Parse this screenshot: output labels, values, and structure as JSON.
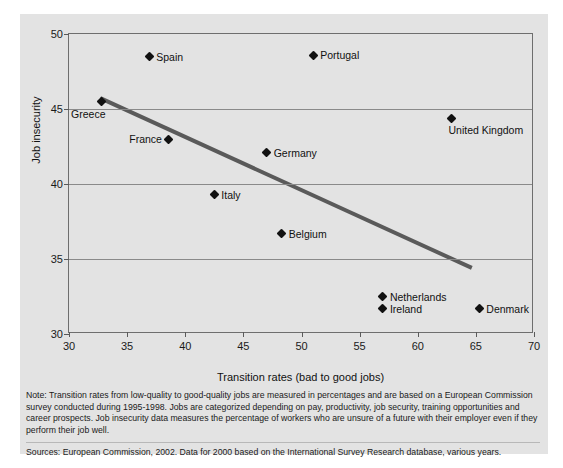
{
  "chart_data": {
    "type": "scatter",
    "title": "",
    "xlabel": "Transition rates (bad to good jobs)",
    "ylabel": "Job insecurity",
    "xlim": [
      30,
      70
    ],
    "ylim": [
      30,
      50
    ],
    "xticks": [
      30,
      35,
      40,
      45,
      50,
      55,
      60,
      65,
      70
    ],
    "yticks": [
      30,
      35,
      40,
      45,
      50
    ],
    "grid": "horizontal",
    "legend": "none",
    "points": [
      {
        "label": "Greece",
        "x": 32.8,
        "y": 45.5,
        "label_pos": "below-left"
      },
      {
        "label": "Spain",
        "x": 36.9,
        "y": 48.5,
        "label_pos": "right"
      },
      {
        "label": "France",
        "x": 38.6,
        "y": 43.0,
        "label_pos": "left"
      },
      {
        "label": "Italy",
        "x": 42.5,
        "y": 39.3,
        "label_pos": "right"
      },
      {
        "label": "Germany",
        "x": 47.0,
        "y": 42.1,
        "label_pos": "right"
      },
      {
        "label": "Belgium",
        "x": 48.3,
        "y": 36.7,
        "label_pos": "right"
      },
      {
        "label": "Portugal",
        "x": 51.0,
        "y": 48.6,
        "label_pos": "right"
      },
      {
        "label": "Netherlands",
        "x": 57.0,
        "y": 32.5,
        "label_pos": "right"
      },
      {
        "label": "Ireland",
        "x": 57.0,
        "y": 31.7,
        "label_pos": "right"
      },
      {
        "label": "United Kingdom",
        "x": 62.9,
        "y": 44.4,
        "label_pos": "below"
      },
      {
        "label": "Denmark",
        "x": 65.3,
        "y": 31.7,
        "label_pos": "right"
      }
    ],
    "trendline": {
      "x1": 32.7,
      "y1": 45.7,
      "x2": 64.8,
      "y2": 34.3,
      "color": "#5a5a5a"
    }
  },
  "notes": {
    "note": "Note: Transition rates from low-quality to good-quality jobs are measured in percentages and are based on a European Commission survey conducted during 1995-1998. Jobs are categorized depending on pay, productivity, job security, training opportunities and career prospects. Job insecurity data measures the percentage of workers who are unsure of a future with their employer even if they perform their job well.",
    "sources": "Sources: European Commission, 2002. Data for 2000 based on the International Survey Research database, various years."
  },
  "colors": {
    "figure_background": "#e3e3e3",
    "marker": "#111111",
    "trendline": "#5a5a5a",
    "gridline": "#8a8a8a",
    "axis": "#6e6e6e"
  }
}
